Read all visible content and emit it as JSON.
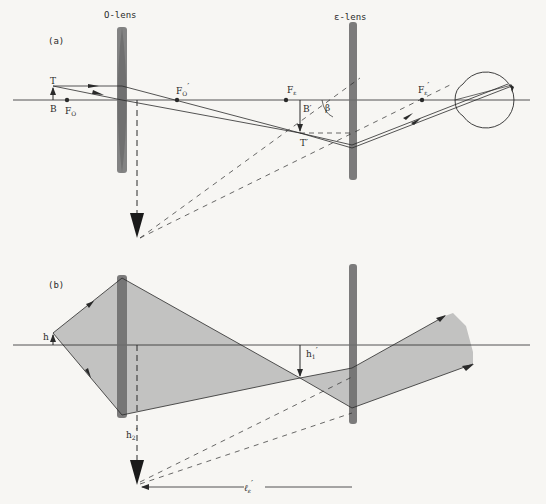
{
  "panel_a": {
    "label": "(a)",
    "objective_lens_label": "O-lens",
    "eyepiece_lens_label": "ε-lens",
    "points": {
      "T": "T",
      "B": "B",
      "F_O": "F",
      "F_O_sub": "O",
      "F_O_prime": "F",
      "F_O_prime_sub": "O",
      "F_O_prime_mark": "′",
      "F_e": "F",
      "F_e_sub": "ε",
      "F_e_prime": "F",
      "F_e_prime_sub": "ε",
      "F_e_prime_mark": "′",
      "B_prime": "B′",
      "T_prime": "T′",
      "beta": "β"
    },
    "elements": [
      "object arrow TB",
      "objective lens",
      "intermediate image B'T'",
      "eyepiece lens",
      "eye",
      "virtual image (dashed)"
    ]
  },
  "panel_b": {
    "label": "(b)",
    "h": "h",
    "h1_prime": "h",
    "h1_prime_sub": "1",
    "h1_prime_mark": "′",
    "h2_prime": "h",
    "h2_prime_sub": "2",
    "h2_prime_mark": "′",
    "l_e_prime": "ℓ",
    "l_e_prime_sub": "ε",
    "l_e_prime_mark": "′"
  },
  "colors": {
    "background": "#f7f6f3",
    "line": "#2a2a2a",
    "lens": "#6e6e6e",
    "beam_fill": "#b9b9b7"
  }
}
